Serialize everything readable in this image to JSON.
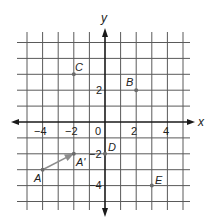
{
  "figure": {
    "type": "coordinate-grid",
    "axes": {
      "x_label": "x",
      "y_label": "y",
      "x_range": [
        -5,
        5
      ],
      "y_range": [
        -5,
        5
      ],
      "x_ticks": [
        {
          "value": -4,
          "label": "−4"
        },
        {
          "value": -2,
          "label": "−2"
        },
        {
          "value": 0,
          "label": "0"
        },
        {
          "value": 2,
          "label": "2"
        },
        {
          "value": 4,
          "label": "4"
        }
      ],
      "y_ticks": [
        {
          "value": 2,
          "label": "2"
        },
        {
          "value": -2,
          "label": "−2"
        },
        {
          "value": -4,
          "label": "−4"
        }
      ]
    },
    "points": [
      {
        "name": "A",
        "label": "A",
        "x": -4,
        "y": -3
      },
      {
        "name": "A-prime",
        "label": "A'",
        "x": -2,
        "y": -2
      },
      {
        "name": "B",
        "label": "B",
        "x": 2,
        "y": 2
      },
      {
        "name": "C",
        "label": "C",
        "x": -2,
        "y": 3
      },
      {
        "name": "D",
        "label": "D",
        "x": 0,
        "y": -2
      },
      {
        "name": "E",
        "label": "E",
        "x": 3,
        "y": -4
      }
    ],
    "vectors": [
      {
        "from": "A",
        "to": "A'",
        "color": "#8c8c8c"
      }
    ],
    "colors": {
      "grid": "#5a5a5a",
      "axis": "#1a1a1a",
      "point": "#6b6b6b",
      "vector": "#8c8c8c"
    }
  }
}
